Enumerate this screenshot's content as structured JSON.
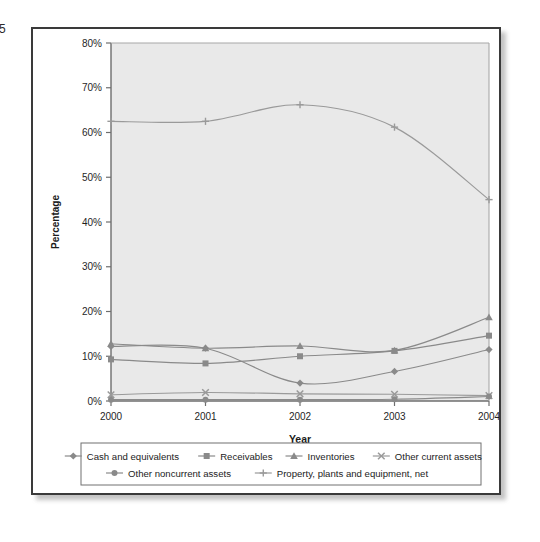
{
  "page": {
    "page_number": "5"
  },
  "chart_data": {
    "type": "line",
    "title": "",
    "xlabel": "Year",
    "ylabel": "Percentage",
    "categories": [
      "2000",
      "2001",
      "2002",
      "2003",
      "2004"
    ],
    "x": [
      2000,
      2001,
      2002,
      2003,
      2004
    ],
    "ylim": [
      0,
      80
    ],
    "ytick_labels": [
      "0%",
      "10%",
      "20%",
      "30%",
      "40%",
      "50%",
      "60%",
      "70%",
      "80%"
    ],
    "ytick_values": [
      0,
      10,
      20,
      30,
      40,
      50,
      60,
      70,
      80
    ],
    "grid": false,
    "legend_position": "bottom",
    "series": [
      {
        "name": "Cash and equivalents",
        "marker": "diamond",
        "color": "#8a8a8a",
        "values": [
          12.2,
          11.8,
          4.0,
          6.6,
          11.5
        ]
      },
      {
        "name": "Receivables",
        "marker": "square",
        "color": "#8a8a8a",
        "values": [
          9.3,
          8.4,
          10.0,
          11.2,
          14.6
        ]
      },
      {
        "name": "Inventories",
        "marker": "triangle",
        "color": "#8a8a8a",
        "values": [
          12.8,
          11.8,
          12.3,
          11.3,
          18.7
        ]
      },
      {
        "name": "Other current assets",
        "marker": "cross",
        "color": "#9a9a9a",
        "values": [
          1.4,
          1.9,
          1.6,
          1.5,
          1.2
        ]
      },
      {
        "name": "Other noncurrent assets",
        "marker": "circle",
        "color": "#8a8a8a",
        "values": [
          0.3,
          0.3,
          0.3,
          0.4,
          1.0
        ]
      },
      {
        "name": "Property, plants and equipment, net",
        "marker": "plus",
        "color": "#9a9a9a",
        "values": [
          62.5,
          62.5,
          66.2,
          61.2,
          45.0
        ]
      }
    ]
  },
  "legend": {
    "row1": [
      "Cash and equivalents",
      "Receivables",
      "Inventories",
      "Other current assets"
    ],
    "row2": [
      "Other noncurrent assets",
      "Property, plants and equipment, net"
    ]
  },
  "colors": {
    "plot_background": "#e9e9e9",
    "frame_border": "#3a3a3a",
    "axis": "#6e6e6e",
    "line": "#8a8a8a",
    "text": "#1c1c1c"
  }
}
